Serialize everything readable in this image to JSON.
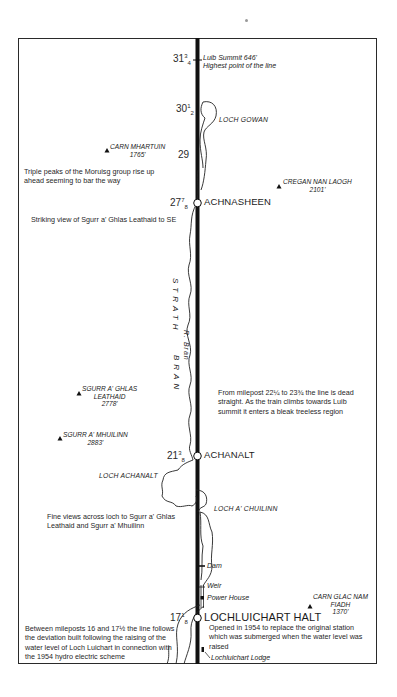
{
  "map": {
    "line": "Kyle of Lochalsh line",
    "mileposts": [
      {
        "id": "mp-31-3-4",
        "whole": "31",
        "fraction": "3/4"
      },
      {
        "id": "mp-30-1-2",
        "whole": "30",
        "fraction": "1/2"
      },
      {
        "id": "mp-29",
        "whole": "29",
        "fraction": ""
      },
      {
        "id": "mp-27-7-8",
        "whole": "27",
        "fraction": "7/8"
      },
      {
        "id": "mp-21-3-8",
        "whole": "21",
        "fraction": "3/8"
      },
      {
        "id": "mp-17-1-8",
        "whole": "17",
        "fraction": "1/8"
      }
    ],
    "summit": {
      "name": "Luib Summit 646'",
      "note": "Highest point of the line"
    },
    "stations": [
      {
        "name": "ACHNASHEEN"
      },
      {
        "name": "ACHANALT"
      },
      {
        "name": "LOCHLUICHART HALT"
      }
    ],
    "lochs": [
      {
        "name": "LOCH GOWAN"
      },
      {
        "name": "LOCH ACHANALT"
      },
      {
        "name": "LOCH A' CHUILINN"
      }
    ],
    "peaks": [
      {
        "name": "CARN MHARTUIN",
        "height": "1765'"
      },
      {
        "name": "CREGAN NAN LAOGH",
        "height": "2101'"
      },
      {
        "name": "SGURR A' GHLAS LEATHAID",
        "name_line1": "SGURR A' GHLAS",
        "name_line2": "LEATHAID",
        "height": "2778'"
      },
      {
        "name": "SGURR A' MHUILINN",
        "height": "2883'"
      },
      {
        "name": "CARN GLAC NAM FIADH",
        "name_line1": "CARN GLAC NAM",
        "name_line2": "FIADH",
        "height": "1370'"
      }
    ],
    "features": {
      "dam": "Dam",
      "weir": "Weir",
      "power_house": "Power House",
      "lodge": "Lochluichart Lodge",
      "river": "R. Bran",
      "valley": "STRATH",
      "valley2": "BRAN"
    },
    "notes": {
      "triple_peaks": "Triple peaks of the Moruisg group rise up ahead seeming to bar the way",
      "striking_view": "Striking view of Sgurr a' Ghlas Leathaid to SE",
      "dead_straight": "From milepost 22¼ to 23¾  the line is dead straight. As the train climbs towards Luib summit it enters a bleak treeless region",
      "fine_views": "Fine views across loch to Sgurr a' Ghlas Leathaid and Sgurr a' Mhuilinn",
      "deviation": "Between mileposts 16 and 17½ the line follows the deviation built following the raising of the water level of Loch Luichart in connection with the 1954 hydro electric scheme",
      "halt_opened": "Opened in 1954 to replace the original station which was submerged when the water level was raised"
    },
    "colors": {
      "ink": "#1a1a1a",
      "paper": "#ffffff"
    }
  }
}
